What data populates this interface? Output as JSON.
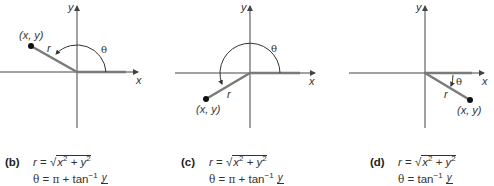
{
  "panels": [
    {
      "id": "b",
      "label": "(b)",
      "point_label": "(x, y)",
      "r_label": "r",
      "theta_label": "θ",
      "x_axis_label": "x",
      "y_axis_label": "y",
      "quadrant": "II",
      "formula_r": {
        "lhs": "r",
        "eq": "=",
        "rad": "√",
        "x": "x",
        "sq": "2",
        "plus": "+",
        "y": "y"
      },
      "formula_theta": {
        "lhs": "θ",
        "eq": "=",
        "pi": "π",
        "plus": "+",
        "tan": "tan",
        "inv": "−1",
        "num": "y",
        "den": "x"
      }
    },
    {
      "id": "c",
      "label": "(c)",
      "point_label": "(x, y)",
      "r_label": "r",
      "theta_label": "θ",
      "x_axis_label": "x",
      "y_axis_label": "y",
      "quadrant": "III",
      "formula_r": {
        "lhs": "r",
        "eq": "=",
        "rad": "√",
        "x": "x",
        "sq": "2",
        "plus": "+",
        "y": "y"
      },
      "formula_theta": {
        "lhs": "θ",
        "eq": "=",
        "pi": "π",
        "plus": "+",
        "tan": "tan",
        "inv": "−1",
        "num": "y",
        "den": "x"
      }
    },
    {
      "id": "d",
      "label": "(d)",
      "point_label": "(x, y)",
      "r_label": "r",
      "theta_label": "θ",
      "x_axis_label": "x",
      "y_axis_label": "y",
      "quadrant": "IV",
      "formula_r": {
        "lhs": "r",
        "eq": "=",
        "rad": "√",
        "x": "x",
        "sq": "2",
        "plus": "+",
        "y": "y"
      },
      "formula_theta": {
        "lhs": "θ",
        "eq": "=",
        "tan": "tan",
        "inv": "−1",
        "num": "y",
        "den": "x"
      }
    }
  ],
  "colors": {
    "axis": "#444444",
    "ray": "#7a7a7a",
    "point": "#111111",
    "text": "#333333"
  }
}
